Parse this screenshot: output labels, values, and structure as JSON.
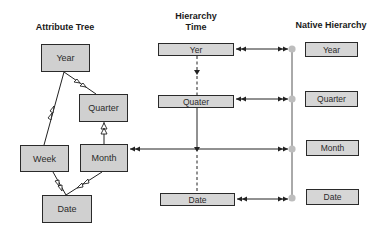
{
  "titles": {
    "attribute_tree": "Attribute Tree",
    "hierarchy_time_line1": "Hierarchy",
    "hierarchy_time_line2": "Time",
    "native_hierarchy": "Native Hierarchy"
  },
  "attribute_tree": {
    "nodes": [
      {
        "id": "year",
        "label": "Year"
      },
      {
        "id": "quarter",
        "label": "Quarter"
      },
      {
        "id": "week",
        "label": "Week"
      },
      {
        "id": "month",
        "label": "Month"
      },
      {
        "id": "date",
        "label": "Date"
      }
    ],
    "edges": [
      {
        "from": "week",
        "to": "year"
      },
      {
        "from": "quarter",
        "to": "year"
      },
      {
        "from": "month",
        "to": "quarter"
      },
      {
        "from": "date",
        "to": "week"
      },
      {
        "from": "date",
        "to": "month"
      }
    ]
  },
  "hierarchy_time": {
    "levels": [
      {
        "id": "yer",
        "label": "Yer"
      },
      {
        "id": "quater",
        "label": "Quater"
      },
      {
        "id": "date",
        "label": "Date"
      }
    ]
  },
  "native_hierarchy": {
    "levels": [
      {
        "id": "year",
        "label": "Year"
      },
      {
        "id": "quarter",
        "label": "Quarter"
      },
      {
        "id": "month",
        "label": "Month"
      },
      {
        "id": "date",
        "label": "Date"
      }
    ]
  },
  "colors": {
    "node_fill": "#d4d4d4",
    "stroke": "#2a2a2a",
    "connector_dot": "#bdbdbd",
    "spine": "#555555"
  }
}
